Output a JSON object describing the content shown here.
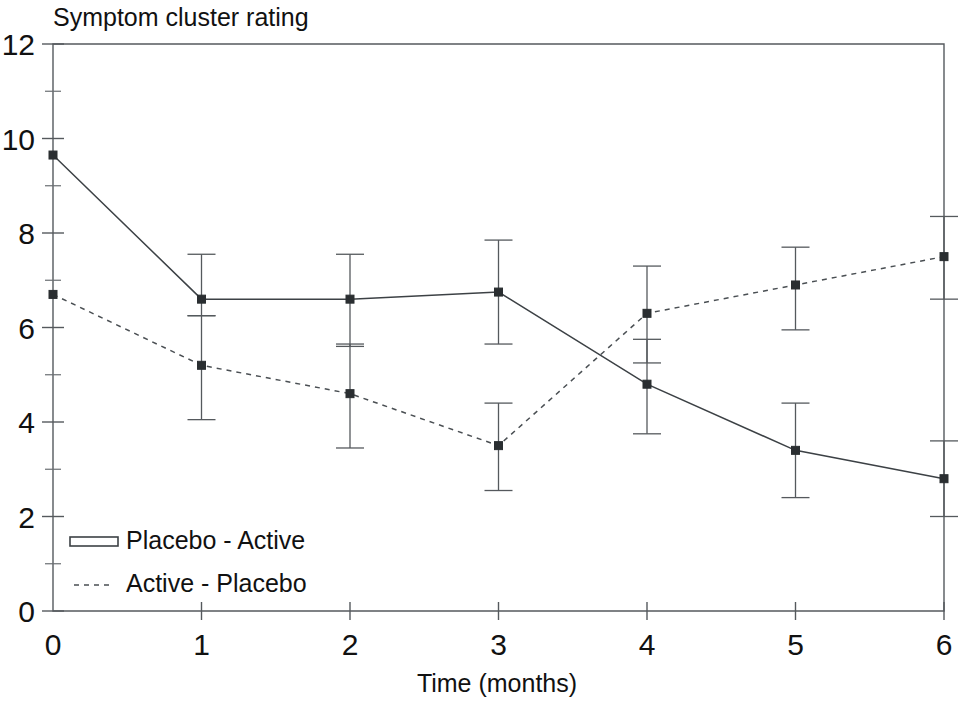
{
  "chart_data": {
    "type": "line",
    "title": "Symptom cluster rating",
    "xlabel": "Time (months)",
    "ylabel": "",
    "x": [
      0,
      1,
      2,
      3,
      4,
      5,
      6
    ],
    "xlim": [
      0,
      6
    ],
    "ylim": [
      0,
      12
    ],
    "x_ticks": [
      "0",
      "1",
      "2",
      "3",
      "4",
      "5",
      "6"
    ],
    "y_ticks": [
      "0",
      "2",
      "4",
      "6",
      "8",
      "10",
      "12"
    ],
    "y_minor_ticks": [
      1,
      3,
      5,
      7,
      9,
      11
    ],
    "grid": false,
    "legend_position": "bottom-left",
    "series": [
      {
        "name": "Placebo - Active",
        "style": "solid",
        "marker": "square",
        "values": [
          9.65,
          6.6,
          6.6,
          6.75,
          4.8,
          3.4,
          2.8
        ],
        "err_low": [
          null,
          6.25,
          5.6,
          5.65,
          3.75,
          2.4,
          2.0
        ],
        "err_high": [
          null,
          7.55,
          7.55,
          7.85,
          5.75,
          4.4,
          3.6
        ]
      },
      {
        "name": "Active - Placebo",
        "style": "dotted",
        "marker": "square",
        "values": [
          6.7,
          5.2,
          4.6,
          3.5,
          6.3,
          6.9,
          7.5
        ],
        "err_low": [
          null,
          4.05,
          3.45,
          2.55,
          5.25,
          5.95,
          6.6
        ],
        "err_high": [
          null,
          6.25,
          5.65,
          4.4,
          7.3,
          7.7,
          8.35
        ]
      }
    ]
  },
  "legend": {
    "items": [
      {
        "label": "Placebo - Active",
        "style": "solid"
      },
      {
        "label": "Active - Placebo",
        "style": "dotted"
      }
    ]
  },
  "colors": {
    "axis": "#55595d",
    "series_solid": "#3c4145",
    "series_dotted": "#4a4f53",
    "text": "#111111",
    "background": "#ffffff"
  }
}
